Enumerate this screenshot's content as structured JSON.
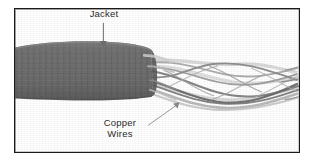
{
  "figure": {
    "background_color": "#ffffff",
    "frame": {
      "name": "figure-border",
      "color": "#1a1a1a",
      "width_px": 286,
      "height_px": 145
    },
    "labels": [
      {
        "id": "jacket",
        "text": "Jacket",
        "lines": [
          "Jacket"
        ],
        "color": "#2b2b2b",
        "leader": {
          "type": "arrow",
          "direction": "down",
          "from": [
            103,
            22
          ],
          "to": [
            103,
            44
          ],
          "color": "#6e6e6e"
        }
      },
      {
        "id": "copper-wires",
        "text": "Copper Wires",
        "lines": [
          "Copper",
          "Wires"
        ],
        "color": "#2b2b2b",
        "leader": {
          "type": "arrow",
          "direction": "up-right",
          "from": [
            133,
            124
          ],
          "to": [
            176,
            104
          ],
          "color": "#9a9a9a"
        }
      }
    ],
    "parts": [
      {
        "id": "jacket-sheath",
        "name": "cable-jacket",
        "description": "dark gray outer insulating jacket of the cable",
        "color": "#6f6f6f",
        "edge_color": "#4a4a4a"
      },
      {
        "id": "copper-wire-bundle",
        "name": "copper-wire-bundle",
        "description": "twisted pairs of copper wires emerging from the cut jacket end",
        "color": "#9b9b9b",
        "strand_count": 8
      }
    ]
  }
}
